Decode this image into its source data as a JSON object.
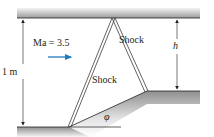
{
  "diagram": {
    "title": "",
    "flow": {
      "mach_label": "Ma = 3.5",
      "arrow_direction": "right"
    },
    "shocks": [
      {
        "id": "incident",
        "label": "Shock"
      },
      {
        "id": "reflected",
        "label": "Shock"
      }
    ],
    "dimensions": {
      "channel_height": "1 m",
      "step_height": "h",
      "ramp_angle": "φ"
    },
    "colors": {
      "flow_arrow": "#1f7bbf",
      "line": "#231f20",
      "wall_dark": "#8c8c8c",
      "wall_light": "#f2f2f2"
    }
  }
}
